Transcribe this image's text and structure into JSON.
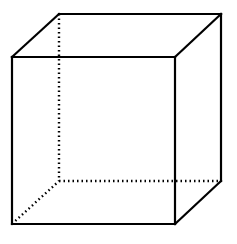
{
  "diagram": {
    "type": "wireframe-cube",
    "stroke_color": "#000000",
    "background_color": "#ffffff",
    "vertices": {
      "front_top_left": [
        12,
        57
      ],
      "front_top_right": [
        175,
        57
      ],
      "front_bottom_left": [
        12,
        224
      ],
      "front_bottom_right": [
        175,
        224
      ],
      "back_top_left": [
        59,
        14
      ],
      "back_top_right": [
        221,
        14
      ],
      "back_bottom_left": [
        59,
        181
      ],
      "back_bottom_right": [
        221,
        181
      ]
    },
    "visible_edges": [
      [
        "front_top_left",
        "front_top_right"
      ],
      [
        "front_top_right",
        "front_bottom_right"
      ],
      [
        "front_bottom_right",
        "front_bottom_left"
      ],
      [
        "front_bottom_left",
        "front_top_left"
      ],
      [
        "back_top_left",
        "back_top_right"
      ],
      [
        "back_top_right",
        "back_bottom_right"
      ],
      [
        "front_top_left",
        "back_top_left"
      ],
      [
        "front_top_right",
        "back_top_right"
      ],
      [
        "front_bottom_right",
        "back_bottom_right"
      ]
    ],
    "hidden_edges": [
      [
        "back_top_left",
        "back_bottom_left"
      ],
      [
        "back_bottom_left",
        "back_bottom_right"
      ],
      [
        "front_bottom_left",
        "back_bottom_left"
      ]
    ]
  }
}
